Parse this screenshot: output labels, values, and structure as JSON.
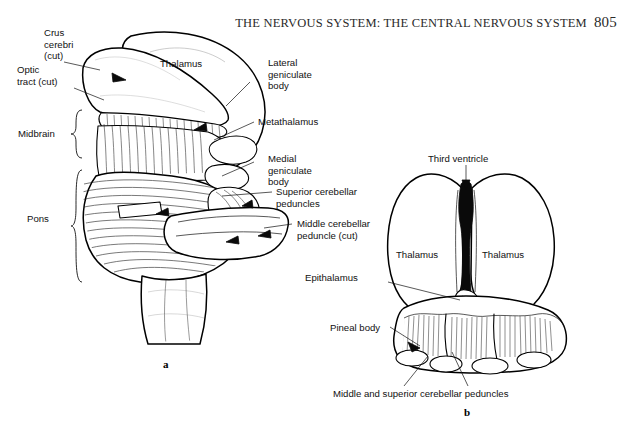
{
  "header": {
    "title": "THE NERVOUS SYSTEM: THE CENTRAL NERVOUS SYSTEM",
    "page_number": "805"
  },
  "figure_a": {
    "caption": "a",
    "labels": {
      "crus_cerebri": "Crus\ncerebri\n(cut)",
      "optic_tract": "Optic\ntract (cut)",
      "midbrain": "Midbrain",
      "pons": "Pons",
      "thalamus": "Thalamus",
      "lateral_geniculate_body": "Lateral\ngeniculate\nbody",
      "metathalamus": "Metathalamus",
      "medial_geniculate_body": "Medial\ngeniculate\nbody",
      "superior_cerebellar_peduncles": "Superior cerebellar\npeduncles",
      "middle_cerebellar_peduncle": "Middle cerebellar\npeduncle (cut)"
    }
  },
  "figure_b": {
    "caption": "b",
    "labels": {
      "third_ventricle": "Third ventricle",
      "thalamus_left": "Thalamus",
      "thalamus_right": "Thalamus",
      "epithalamus": "Epithalamus",
      "pineal_body": "Pineal body",
      "middle_and_superior_cerebellar_peduncles": "Middle and superior cerebellar peduncles"
    }
  },
  "colors": {
    "ink": "#111111",
    "background": "#ffffff",
    "ventricle_fill": "#0a0a0a"
  }
}
